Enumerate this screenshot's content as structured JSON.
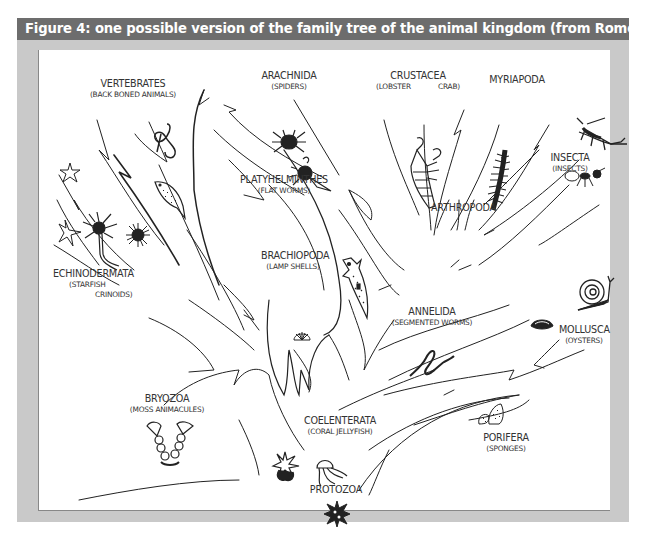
{
  "figure": {
    "title": "Figure 4: one possible version of the family tree of the animal kingdom (from Romer, 1966)",
    "colors": {
      "title_bar": "#6d6d6d",
      "frame": "#c9c9c9",
      "panel": "#ffffff",
      "ink": "#222222",
      "label_text": "#333333"
    }
  },
  "tree": {
    "root": "PROTOZOA",
    "groups": [
      {
        "id": "vertebrates",
        "name": "VERTEBRATES",
        "common": "(BACK BONED ANIMALS)",
        "icons": [
          "snake-icon",
          "fish-icon"
        ]
      },
      {
        "id": "arachnida",
        "name": "ARACHNIDA",
        "common": "(SPIDERS)",
        "icons": [
          "spider-icon",
          "scorpion-icon"
        ]
      },
      {
        "id": "crustacea",
        "name": "CRUSTACEA",
        "common_left": "(LOBSTER",
        "common_right": "CRAB)",
        "icons": [
          "lobster-icon"
        ]
      },
      {
        "id": "myriapoda",
        "name": "MYRIAPODA",
        "common": "",
        "icons": [
          "centipede-icon"
        ]
      },
      {
        "id": "insecta",
        "name": "INSECTA",
        "common": "(INSECTS)",
        "icons": [
          "grasshopper-icon",
          "ant-icon"
        ]
      },
      {
        "id": "platyhelminthes",
        "name": "PLATYHELMINTHES",
        "common": "(FLAT WORMS)",
        "icons": [
          "flatworm-icon"
        ]
      },
      {
        "id": "arthropoda",
        "name": "ARTHROPODA",
        "common": "",
        "icons": []
      },
      {
        "id": "echinodermata",
        "name": "ECHINODERMATA",
        "common_line1": "(STARFISH",
        "common_line2": "CRINOIDS)",
        "icons": [
          "starfish-icon",
          "crinoid-icon",
          "sea-urchin-icon"
        ]
      },
      {
        "id": "brachiopoda",
        "name": "BRACHIOPODA",
        "common": "(LAMP SHELLS)",
        "icons": [
          "lamp-shell-icon"
        ]
      },
      {
        "id": "annelida",
        "name": "ANNELIDA",
        "common": "(SEGMENTED WORMS)",
        "icons": [
          "segmented-worm-icon"
        ]
      },
      {
        "id": "mollusca",
        "name": "MOLLUSCA",
        "common": "(OYSTERS)",
        "icons": [
          "snail-icon",
          "oyster-icon"
        ]
      },
      {
        "id": "bryozoa",
        "name": "BRYOZOA",
        "common": "(MOSS ANIMACULES)",
        "icons": [
          "bryozoan-icon"
        ]
      },
      {
        "id": "coelenterata",
        "name": "COELENTERATA",
        "common": "(CORAL JELLYFISH)",
        "icons": [
          "coral-icon",
          "jellyfish-icon"
        ]
      },
      {
        "id": "protozoa",
        "name": "PROTOZOA",
        "common": "",
        "icons": [
          "amoeba-icon"
        ]
      },
      {
        "id": "porifera",
        "name": "PORIFERA",
        "common": "(SPONGES)",
        "icons": [
          "sponge-icon"
        ]
      }
    ]
  }
}
